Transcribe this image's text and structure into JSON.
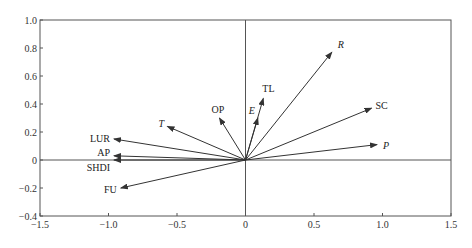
{
  "chart_data": {
    "type": "biplot-vectors",
    "title": "",
    "xlabel": "",
    "ylabel": "",
    "xlim": [
      -1.5,
      1.5
    ],
    "ylim": [
      -0.4,
      1.0
    ],
    "x_ticks": [
      -1.5,
      -1.0,
      -0.5,
      0,
      0.5,
      1.0,
      1.5
    ],
    "x_tick_labels": [
      "−1.5",
      "−1.0",
      "−0.5",
      "0",
      "0.5",
      "1.0",
      "1.5"
    ],
    "y_ticks": [
      -0.4,
      -0.2,
      0,
      0.2,
      0.4,
      0.6,
      0.8,
      1.0
    ],
    "y_tick_labels": [
      "−0.4",
      "−0.2",
      "0",
      "0.2",
      "0.4",
      "0.6",
      "0.8",
      "1.0"
    ],
    "grid": false,
    "origin_lines": true,
    "vectors": [
      {
        "name": "R",
        "x": 0.63,
        "y": 0.77,
        "italic": true
      },
      {
        "name": "SC",
        "x": 0.92,
        "y": 0.37,
        "italic": false
      },
      {
        "name": "P",
        "x": 0.96,
        "y": 0.11,
        "italic": true
      },
      {
        "name": "TL",
        "x": 0.13,
        "y": 0.44,
        "italic": false
      },
      {
        "name": "E",
        "x": 0.09,
        "y": 0.3,
        "italic": true
      },
      {
        "name": "OP",
        "x": -0.19,
        "y": 0.3,
        "italic": false
      },
      {
        "name": "T",
        "x": -0.57,
        "y": 0.24,
        "italic": true
      },
      {
        "name": "LUR",
        "x": -0.96,
        "y": 0.15,
        "italic": false
      },
      {
        "name": "AP",
        "x": -0.96,
        "y": 0.03,
        "italic": false
      },
      {
        "name": "SHDI",
        "x": -0.96,
        "y": 0.0,
        "italic": false
      },
      {
        "name": "FU",
        "x": -0.91,
        "y": -0.2,
        "italic": false
      }
    ]
  },
  "colors": {
    "axis": "#555555",
    "vector": "#333333",
    "text": "#222222"
  }
}
